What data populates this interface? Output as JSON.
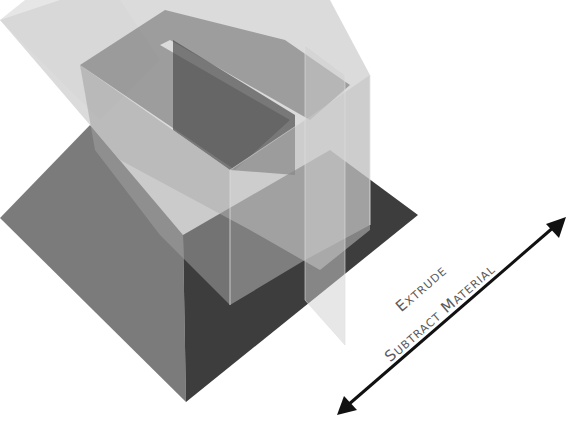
{
  "diagram": {
    "labels": {
      "line1": "Extrude",
      "line2": "Subtract Material"
    },
    "arrow": {
      "direction": "bidirectional",
      "color": "#111111"
    },
    "colors": {
      "background": "#ffffff",
      "base_left_face": "#7a7a7a",
      "base_right_face": "#3f3f3f",
      "translucent_block": "#9a9a9a",
      "block_dark_face": "#555555",
      "text": "#5a5a5a"
    }
  }
}
